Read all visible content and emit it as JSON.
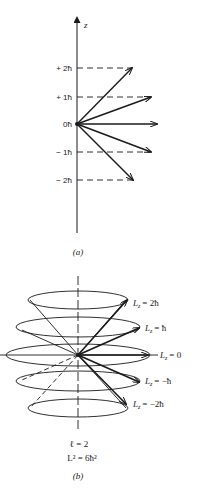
{
  "figure_a": {
    "axis_label": "z",
    "ticks": [
      {
        "label": "+ 2ħ",
        "m": 2
      },
      {
        "label": "+ 1ħ",
        "m": 1
      },
      {
        "label": "0ħ",
        "m": 0
      },
      {
        "label": "− 1ħ",
        "m": -1
      },
      {
        "label": "− 2ħ",
        "m": -2
      }
    ],
    "caption": "(a)"
  },
  "figure_b": {
    "labels": [
      {
        "lz": "L",
        "sub": "z",
        "value": "= 2ħ"
      },
      {
        "lz": "L",
        "sub": "z",
        "value": "= ħ"
      },
      {
        "lz": "L",
        "sub": "z",
        "value": "= 0"
      },
      {
        "lz": "L",
        "sub": "z",
        "value": "= −ħ"
      },
      {
        "lz": "L",
        "sub": "z",
        "value": "= −2ħ"
      }
    ],
    "quantum_number": "ℓ = 2",
    "l_squared": "L² = 6ħ²",
    "caption": "(b)"
  },
  "colors": {
    "ink": "#1a1a1a",
    "background": "#ffffff"
  }
}
